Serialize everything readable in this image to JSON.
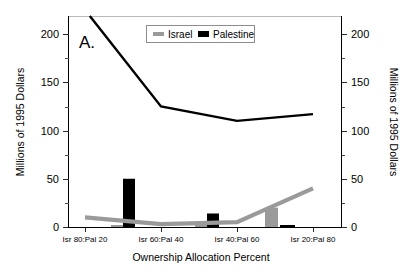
{
  "chart_data": {
    "type": "bar",
    "title": "",
    "panel_label": "A.",
    "xlabel": "Ownership Allocation Percent",
    "ylabel": "Millions of 1995 Dollars",
    "ylabel_right": "Millions of 1995 Dollars",
    "categories": [
      "Isr 80:Pal 20",
      "Isr 60:Pal 40",
      "Isr 40:Pal 60",
      "Isr 20:Pal 80"
    ],
    "ylim": [
      0,
      220
    ],
    "yticks_major": [
      0,
      50,
      100,
      150,
      200
    ],
    "yticks_minor": [
      25,
      75,
      125,
      175
    ],
    "ytick_labels": [
      "0",
      "50",
      "100",
      "150",
      "200"
    ],
    "grid": false,
    "legend_position": "top-center",
    "dual_axis": true,
    "series": [
      {
        "name": "Israel",
        "kind": "line",
        "color": "#9a9a9a",
        "values": [
          10,
          3,
          5,
          40
        ]
      },
      {
        "name": "Palestine",
        "kind": "line",
        "color": "#000000",
        "values": [
          225,
          125,
          110,
          117
        ]
      },
      {
        "name": "Israel",
        "kind": "bar",
        "color": "#9a9a9a",
        "values": [
          2,
          2,
          20,
          0
        ]
      },
      {
        "name": "Palestine",
        "kind": "bar",
        "color": "#000000",
        "values": [
          50,
          14,
          2,
          0
        ]
      }
    ]
  },
  "legend": {
    "entries": [
      {
        "label": "Israel",
        "color": "#9a9a9a"
      },
      {
        "label": "Palestine",
        "color": "#000000"
      }
    ]
  },
  "axes": {
    "left_title": "Millions of 1995 Dollars",
    "right_title": "Millions of 1995 Dollars",
    "bottom_title": "Ownership Allocation Percent",
    "y_tick_0": "0",
    "y_tick_50": "50",
    "y_tick_100": "100",
    "y_tick_150": "150",
    "y_tick_200": "200",
    "x_tick_1": "Isr 80:Pal 20",
    "x_tick_2": "Isr 60:Pal 40",
    "x_tick_3": "Isr 40:Pal 60",
    "x_tick_4": "Isr 20:Pal 80"
  },
  "panel": {
    "label": "A."
  }
}
